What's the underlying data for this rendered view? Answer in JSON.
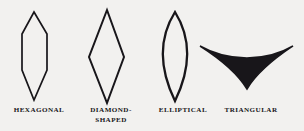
{
  "figure": {
    "background_color": "#f2f1ef",
    "ink_color": "#18161a",
    "shapes": [
      {
        "id": "hexagonal",
        "icon": "hexagonal-leaf-shape-icon",
        "label": "HEXAGONAL",
        "outline_type": "polygon",
        "vertices": "34,12 47,34 47,70 34,100 22,70 22,34",
        "stroke_width": 1.7
      },
      {
        "id": "diamond",
        "icon": "diamond-shaped-leaf-shape-icon",
        "label": "DIAMOND-\nSHAPED",
        "outline_type": "polygon",
        "vertices": "107,10 124,57 107,103 89,57",
        "stroke_width": 2.0
      },
      {
        "id": "elliptical",
        "icon": "elliptical-leaf-shape-icon",
        "label": "ELLIPTICAL",
        "outline_type": "lens",
        "path": "M175,12 C190,36 192,66 175,101 C158,66 160,36 175,12 Z",
        "stroke_width": 2.3
      },
      {
        "id": "triangular",
        "icon": "triangular-leaf-shape-icon",
        "label": "TRIANGULAR",
        "outline_type": "concave-triangle",
        "path": "M200,46 C228,62 266,62 293,46 C272,60 256,74 247,89 C238,74 222,60 200,46 Z",
        "stroke_width": 1.5
      }
    ]
  },
  "chart_data": {
    "type": "diagram",
    "title": "",
    "categories": [
      "HEXAGONAL",
      "DIAMOND-SHAPED",
      "ELLIPTICAL",
      "TRIANGULAR"
    ],
    "legend_position": "below-each-shape"
  }
}
